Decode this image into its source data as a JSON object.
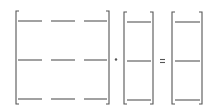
{
  "diagram": {
    "operator_multiply": "·",
    "operator_equals": "=",
    "matrix_a": {
      "rows": 3,
      "cols": 3
    },
    "vector_x": {
      "rows": 3,
      "cols": 1
    },
    "vector_b": {
      "rows": 3,
      "cols": 1
    },
    "stroke_color": "#555555"
  }
}
